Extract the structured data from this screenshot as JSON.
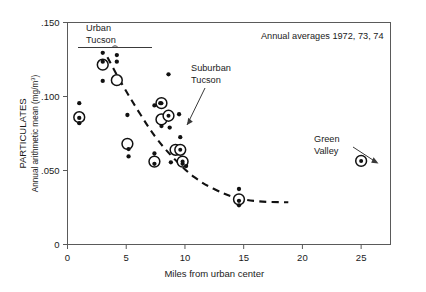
{
  "figure": {
    "note": "Annual averages 1972, 73, 74"
  },
  "axes": {
    "y_title_main": "PARTICULATES",
    "y_title_sub": "Annual arithmetic mean (mg/m",
    "y_title_sub_exp": "3",
    "y_title_sub_end": ")",
    "x_title": "Miles from urban center",
    "y_ticks": [
      ".150",
      ".100",
      ".050",
      "0"
    ],
    "x_ticks": [
      "0",
      "5",
      "10",
      "15",
      "20",
      "25"
    ],
    "xlim": [
      0,
      27.5
    ],
    "ylim": [
      0,
      0.15
    ]
  },
  "annotations": [
    {
      "name": "urban-tucson",
      "line1": "Urban",
      "line2": "Tucson"
    },
    {
      "name": "suburban-tucson",
      "line1": "Suburban",
      "line2": "Tucson"
    },
    {
      "name": "green-valley",
      "line1": "Green",
      "line2": "Valley"
    }
  ],
  "chart_data": {
    "type": "scatter",
    "title": "",
    "subtitle": "Annual averages 1972, 73, 74",
    "xlabel": "Miles from urban center",
    "ylabel": "PARTICULATES  Annual arithmetic mean (mg/m3)",
    "xlim": [
      0,
      27.5
    ],
    "ylim": [
      0,
      0.15
    ],
    "xticks": [
      0,
      5,
      10,
      15,
      20,
      25
    ],
    "yticks": [
      0,
      0.05,
      0.1,
      0.15
    ],
    "grid": false,
    "legend": "none",
    "series": [
      {
        "name": "annual values (small filled dots)",
        "marker": "small-filled-circle",
        "points": [
          {
            "x": 1.0,
            "y": 0.0955
          },
          {
            "x": 1.0,
            "y": 0.0855
          },
          {
            "x": 1.0,
            "y": 0.082
          },
          {
            "x": 3.0,
            "y": 0.1295
          },
          {
            "x": 3.0,
            "y": 0.1235
          },
          {
            "x": 3.0,
            "y": 0.1105
          },
          {
            "x": 4.2,
            "y": 0.128
          },
          {
            "x": 4.2,
            "y": 0.1235
          },
          {
            "x": 5.1,
            "y": 0.0875
          },
          {
            "x": 5.2,
            "y": 0.0645
          },
          {
            "x": 5.2,
            "y": 0.0595
          },
          {
            "x": 7.4,
            "y": 0.094
          },
          {
            "x": 7.4,
            "y": 0.0615
          },
          {
            "x": 7.4,
            "y": 0.0545
          },
          {
            "x": 7.9,
            "y": 0.0955
          },
          {
            "x": 8.0,
            "y": 0.08
          },
          {
            "x": 8.6,
            "y": 0.115
          },
          {
            "x": 8.7,
            "y": 0.079
          },
          {
            "x": 8.8,
            "y": 0.0555
          },
          {
            "x": 9.5,
            "y": 0.088
          },
          {
            "x": 9.6,
            "y": 0.0725
          },
          {
            "x": 9.8,
            "y": 0.0545
          },
          {
            "x": 10.1,
            "y": 0.053
          },
          {
            "x": 14.6,
            "y": 0.0375
          },
          {
            "x": 14.6,
            "y": 0.0295
          },
          {
            "x": 14.6,
            "y": 0.0265
          }
        ]
      },
      {
        "name": "3-year mean (large open circle)",
        "marker": "large-open-circle",
        "points": [
          {
            "x": 1.0,
            "y": 0.086
          },
          {
            "x": 3.0,
            "y": 0.1215
          },
          {
            "x": 4.2,
            "y": 0.111
          },
          {
            "x": 5.1,
            "y": 0.068
          },
          {
            "x": 7.4,
            "y": 0.056
          },
          {
            "x": 8.0,
            "y": 0.0845
          },
          {
            "x": 9.2,
            "y": 0.064
          },
          {
            "x": 14.6,
            "y": 0.0305
          }
        ]
      },
      {
        "name": "mean with center dot (open circle + dot)",
        "marker": "open-circle-with-dot",
        "points": [
          {
            "x": 8.0,
            "y": 0.0955
          },
          {
            "x": 8.6,
            "y": 0.087
          },
          {
            "x": 9.6,
            "y": 0.064
          },
          {
            "x": 9.8,
            "y": 0.056
          },
          {
            "x": 25.0,
            "y": 0.0565
          }
        ]
      }
    ],
    "trend_curve": {
      "name": "fitted dashed trend",
      "style": "dashed",
      "points": [
        {
          "x": 3.4,
          "y": 0.1265
        },
        {
          "x": 4.6,
          "y": 0.109
        },
        {
          "x": 6.2,
          "y": 0.088
        },
        {
          "x": 7.6,
          "y": 0.0715
        },
        {
          "x": 9.2,
          "y": 0.057
        },
        {
          "x": 10.8,
          "y": 0.0455
        },
        {
          "x": 12.4,
          "y": 0.0378
        },
        {
          "x": 14.2,
          "y": 0.032
        },
        {
          "x": 16.2,
          "y": 0.0292
        },
        {
          "x": 18.8,
          "y": 0.0285
        }
      ]
    }
  }
}
